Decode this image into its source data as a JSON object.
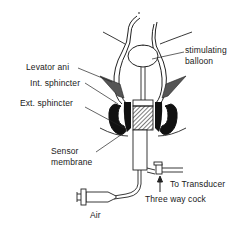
{
  "diagram": {
    "type": "anatomical-schematic",
    "labels": {
      "stimulating_balloon_line1": "stimulating",
      "stimulating_balloon_line2": "balloon",
      "levator_ani": "Levator ani",
      "int_sphincter": "Int. sphincter",
      "ext_sphincter": "Ext. sphincter",
      "sensor_membrane_line1": "Sensor",
      "sensor_membrane_line2": "membrane",
      "to_transducer": "To Transducer",
      "three_way_cock": "Three way cock",
      "air": "Air"
    },
    "colors": {
      "ink": "#1a1a1a",
      "background": "#ffffff",
      "muscle_fill": "#111111",
      "levator_fill": "#555555"
    }
  }
}
